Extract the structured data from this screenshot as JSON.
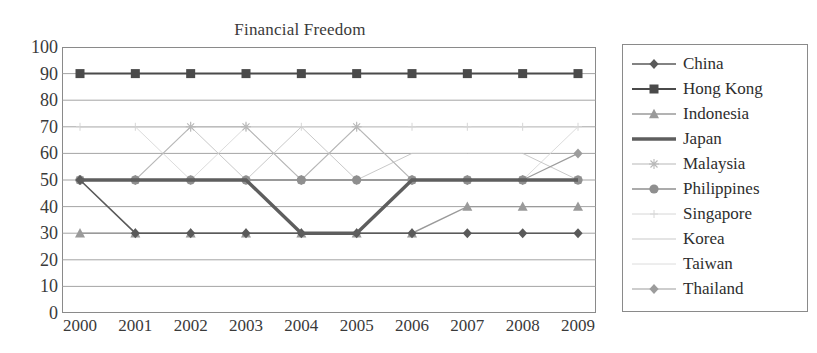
{
  "chart_data": {
    "type": "line",
    "title": "Financial Freedom",
    "xlabel": "",
    "ylabel": "",
    "categories": [
      "2000",
      "2001",
      "2002",
      "2003",
      "2004",
      "2005",
      "2006",
      "2007",
      "2008",
      "2009"
    ],
    "x": [
      2000,
      2001,
      2002,
      2003,
      2004,
      2005,
      2006,
      2007,
      2008,
      2009
    ],
    "ylim": [
      0,
      100
    ],
    "yticks": [
      0,
      10,
      20,
      30,
      40,
      50,
      60,
      70,
      80,
      90,
      100
    ],
    "grid": true,
    "legend_position": "right",
    "series": [
      {
        "name": "China",
        "values": [
          50,
          30,
          30,
          30,
          30,
          30,
          30,
          30,
          30,
          30
        ],
        "color": "#5a5a5a",
        "marker": "diamond",
        "width": 1.6
      },
      {
        "name": "Hong Kong",
        "values": [
          90,
          90,
          90,
          90,
          90,
          90,
          90,
          90,
          90,
          90
        ],
        "color": "#4a4a4a",
        "marker": "square",
        "width": 2.0
      },
      {
        "name": "Indonesia",
        "values": [
          30,
          30,
          30,
          30,
          30,
          30,
          30,
          40,
          40,
          40
        ],
        "color": "#9a9a9a",
        "marker": "triangle",
        "width": 1.4
      },
      {
        "name": "Japan",
        "values": [
          50,
          50,
          50,
          50,
          30,
          30,
          50,
          50,
          50,
          50
        ],
        "color": "#5e5e5e",
        "marker": "none",
        "width": 3.4
      },
      {
        "name": "Malaysia",
        "values": [
          50,
          50,
          70,
          70,
          50,
          70,
          50,
          50,
          50,
          50
        ],
        "color": "#b8b8b8",
        "marker": "star",
        "width": 1.1
      },
      {
        "name": "Philippines",
        "values": [
          50,
          50,
          50,
          50,
          50,
          50,
          50,
          50,
          50,
          50
        ],
        "color": "#8f8f8f",
        "marker": "circle",
        "width": 1.4
      },
      {
        "name": "Singapore",
        "values": [
          70,
          70,
          70,
          70,
          70,
          70,
          70,
          70,
          70,
          70
        ],
        "color": "#d6d6d6",
        "marker": "plus",
        "width": 1.0
      },
      {
        "name": "Korea",
        "values": [
          70,
          70,
          70,
          50,
          70,
          50,
          60,
          60,
          60,
          50
        ],
        "color": "#c9c9c9",
        "marker": "none",
        "width": 1.0
      },
      {
        "name": "Taiwan",
        "values": [
          70,
          70,
          50,
          70,
          50,
          70,
          50,
          50,
          50,
          70
        ],
        "color": "#dcdcdc",
        "marker": "none",
        "width": 1.0
      },
      {
        "name": "Thailand",
        "values": [
          50,
          50,
          50,
          50,
          50,
          50,
          50,
          50,
          50,
          60
        ],
        "color": "#9c9c9c",
        "marker": "diamond",
        "width": 1.2
      }
    ]
  },
  "legend": {
    "items": [
      {
        "label": "China"
      },
      {
        "label": "Hong Kong"
      },
      {
        "label": "Indonesia"
      },
      {
        "label": "Japan"
      },
      {
        "label": "Malaysia"
      },
      {
        "label": "Philippines"
      },
      {
        "label": "Singapore"
      },
      {
        "label": "Korea"
      },
      {
        "label": "Taiwan"
      },
      {
        "label": "Thailand"
      }
    ]
  },
  "style": {
    "grid_color": "#9a9a9a",
    "frame_color": "#8a8a8a",
    "text_color": "#3a3a3a",
    "background": "#ffffff"
  }
}
